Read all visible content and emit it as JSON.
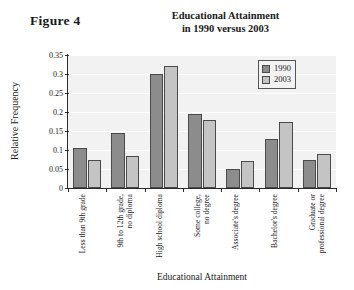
{
  "figure": {
    "label": "Figure 4",
    "title_line1": "Educational Attainment",
    "title_line2": "in 1990 versus 2003"
  },
  "legend": {
    "position": "top-right",
    "entries": [
      {
        "name": "1990",
        "color": "#8c8c8c"
      },
      {
        "name": "2003",
        "color": "#c4c4c4"
      }
    ]
  },
  "chart_data": {
    "type": "bar",
    "title": "Educational Attainment in 1990 versus 2003",
    "xlabel": "Educational Attainment",
    "ylabel": "Relative Frequency",
    "ylim": [
      0,
      0.35
    ],
    "yticks": [
      "0",
      "0.05",
      "0.1",
      "0.15",
      "0.2",
      "0.25",
      "0.3",
      "0.35"
    ],
    "ytick_values": [
      0,
      0.05,
      0.1,
      0.15,
      0.2,
      0.25,
      0.3,
      0.35
    ],
    "grid": true,
    "categories": [
      "Less than 9th grade",
      "9th to 12th grade, no diploma",
      "High school diploma",
      "Some college, no degree",
      "Associate's degree",
      "Bachelor's degree",
      "Graduate or professional degree"
    ],
    "category_lines": [
      [
        "Less than 9th grade",
        ""
      ],
      [
        "9th to 12th grade,",
        "no diploma"
      ],
      [
        "High school diploma",
        ""
      ],
      [
        "Some college,",
        "no degree"
      ],
      [
        "Associate's degree",
        ""
      ],
      [
        "Bachelor's degree",
        ""
      ],
      [
        "Graduate or",
        "professional degree"
      ]
    ],
    "series": [
      {
        "name": "1990",
        "color": "#8c8c8c",
        "values": [
          0.105,
          0.145,
          0.3,
          0.195,
          0.05,
          0.13,
          0.075
        ]
      },
      {
        "name": "2003",
        "color": "#c4c4c4",
        "values": [
          0.075,
          0.085,
          0.32,
          0.18,
          0.07,
          0.175,
          0.09
        ]
      }
    ]
  }
}
